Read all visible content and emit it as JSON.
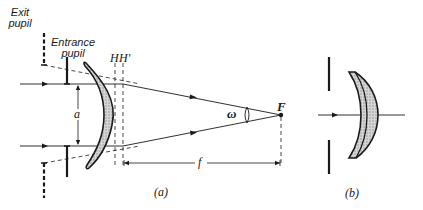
{
  "figure": {
    "panel_a": {
      "caption": "(a)",
      "exit_pupil_label_line1": "Exit",
      "exit_pupil_label_line2": "pupil",
      "entrance_pupil_label_line1": "Entrance",
      "entrance_pupil_label_line2": "pupil",
      "principal_plane_H": "H",
      "principal_plane_H_prime": "H'",
      "aperture_label": "a",
      "field_angle_label": "ω",
      "focal_point_label": "F",
      "focal_length_label": "f"
    },
    "panel_b": {
      "caption": "(b)"
    }
  },
  "colors": {
    "ink": "#1a1a1a",
    "lens_fill": "#c8c8c8"
  }
}
